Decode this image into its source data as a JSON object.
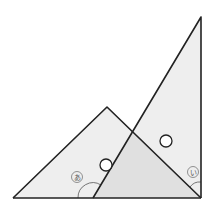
{
  "diagram": {
    "colors": {
      "stroke": "#222222",
      "fill_light": "#eeeeee",
      "fill_overlap": "#e0e0e0",
      "marker_fill": "#ffffff",
      "label_color": "#666666"
    },
    "left_triangle": {
      "points": [
        [
          13,
          198
        ],
        [
          107,
          107
        ],
        [
          201,
          198
        ]
      ]
    },
    "right_triangle": {
      "points": [
        [
          93,
          198
        ],
        [
          201,
          17
        ],
        [
          201,
          198
        ]
      ]
    },
    "overlap_region": {
      "points": [
        [
          93,
          198
        ],
        [
          133,
          131
        ],
        [
          201,
          198
        ]
      ]
    },
    "equal_marks": [
      {
        "cx": 106,
        "cy": 165,
        "r": 6
      },
      {
        "cx": 166,
        "cy": 141,
        "r": 6
      }
    ],
    "angle_labels": [
      {
        "text": "あ",
        "x": 77,
        "y": 177
      },
      {
        "text": "い",
        "x": 193,
        "y": 172
      }
    ]
  }
}
